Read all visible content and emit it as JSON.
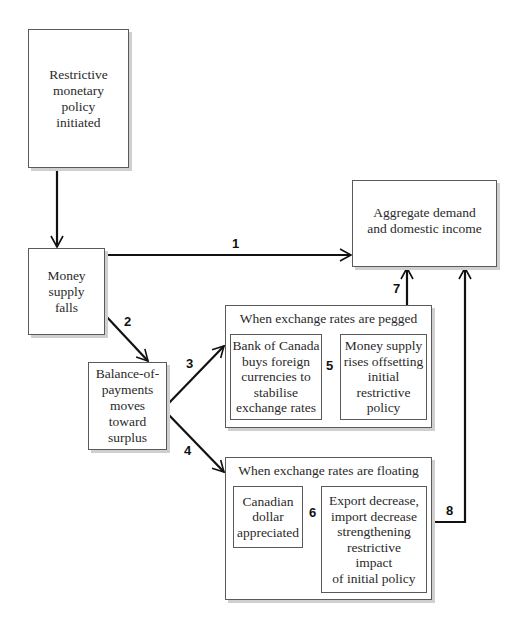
{
  "diagram": {
    "nodes": {
      "restrictive_policy": {
        "label": "Restrictive\nmonetary\npolicy\ninitiated"
      },
      "money_supply_falls": {
        "label": "Money\nsupply\nfalls"
      },
      "aggregate_demand": {
        "label": "Aggregate demand\nand domestic income"
      },
      "balance_of_payments": {
        "label": "Balance-of-\npayments\nmoves\ntoward\nsurplus"
      },
      "pegged_group": {
        "title": "When exchange rates are pegged",
        "left": {
          "label": "Bank of Canada\nbuys foreign\ncurrencies to\nstabilise\nexchange rates"
        },
        "right": {
          "label": "Money supply\nrises offsetting\ninitial\nrestrictive\npolicy"
        }
      },
      "floating_group": {
        "title": "When exchange rates are floating",
        "left": {
          "label": "Canadian\ndollar\nappreciated"
        },
        "right": {
          "label": "Export decrease,\nimport decrease\nstrengthening\nrestrictive\nimpact\nof initial policy"
        }
      }
    },
    "edges": [
      {
        "id": "1",
        "from": "money_supply_falls",
        "to": "aggregate_demand"
      },
      {
        "id": "2",
        "from": "money_supply_falls",
        "to": "balance_of_payments"
      },
      {
        "id": "3",
        "from": "balance_of_payments",
        "to": "pegged_group"
      },
      {
        "id": "4",
        "from": "balance_of_payments",
        "to": "floating_group"
      },
      {
        "id": "5",
        "from": "pegged_group.left",
        "to": "pegged_group.right"
      },
      {
        "id": "6",
        "from": "floating_group.left",
        "to": "floating_group.right"
      },
      {
        "id": "7",
        "from": "pegged_group",
        "to": "aggregate_demand"
      },
      {
        "id": "8",
        "from": "floating_group",
        "to": "aggregate_demand"
      }
    ],
    "edge_labels": {
      "e1": "1",
      "e2": "2",
      "e3": "3",
      "e4": "4",
      "e5": "5",
      "e6": "6",
      "e7": "7",
      "e8": "8"
    }
  }
}
